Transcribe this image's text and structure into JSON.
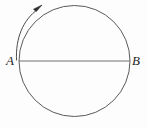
{
  "figure": {
    "type": "geometry-diagram",
    "canvas": {
      "width": 147,
      "height": 128,
      "background": "#fdfdfd"
    },
    "labels": {
      "point_a": "A",
      "point_b": "B"
    },
    "colors": {
      "stroke": "#5a5a5a",
      "diameter_stroke": "#6e6e6e",
      "arrow_stroke": "#4a4a4a",
      "arrowhead_fill": "#2b2b2b",
      "label_color": "#1d1d1d"
    },
    "geometry": {
      "circle": {
        "cx": 74.5,
        "cy": 61,
        "r": 55.5
      },
      "diameter": {
        "x1": 19,
        "y1": 61,
        "x2": 130,
        "y2": 61
      },
      "rotation_arrow": {
        "direction": "clockwise",
        "arc_radius": 66,
        "start": {
          "x": 16,
          "y": 58
        },
        "end": {
          "x": 38,
          "y": 9
        },
        "arrowhead": {
          "x": 41,
          "y": 6
        }
      }
    },
    "elements": {
      "circle_name": "circle-outline",
      "diameter_name": "diameter-line-ab",
      "arrow_name": "rotation-direction-arrow",
      "arrowhead_name": "arrowhead-icon"
    }
  }
}
